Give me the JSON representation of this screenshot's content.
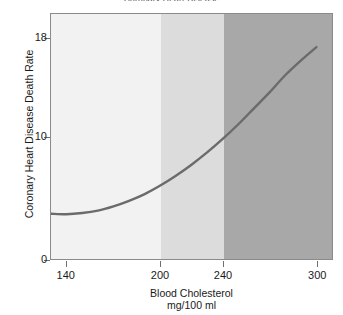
{
  "figure": {
    "title_clipped": "Coronary Heart Disease",
    "background": "#ffffff",
    "frame_color": "#8a8a8a"
  },
  "chart_data": {
    "type": "line",
    "title": "Coronary Heart Disease",
    "xlabel": "Blood Cholesterol",
    "xlabel_units": "mg/100 ml",
    "ylabel": "Coronary Heart Disease Death Rate",
    "xlim": [
      130,
      310
    ],
    "ylim": [
      0,
      20
    ],
    "xticks": [
      140,
      200,
      240,
      300
    ],
    "xticklabels": [
      "140",
      "200",
      "240",
      "300"
    ],
    "yticks": [
      0,
      10,
      18
    ],
    "yticklabels": [
      "0",
      "10",
      "18"
    ],
    "grid": false,
    "legend": "none",
    "line_color": "#6b6b6b",
    "line_width": 2.4,
    "x": [
      130,
      140,
      150,
      160,
      170,
      180,
      190,
      200,
      210,
      220,
      230,
      240,
      250,
      260,
      270,
      280,
      290,
      300
    ],
    "values": [
      3.7,
      3.65,
      3.75,
      3.95,
      4.3,
      4.75,
      5.3,
      6.0,
      6.8,
      7.7,
      8.7,
      9.8,
      11.0,
      12.3,
      13.6,
      15.0,
      16.2,
      17.3
    ],
    "series": [
      {
        "name": "CHD death rate",
        "values": [
          3.7,
          3.65,
          3.75,
          3.95,
          4.3,
          4.75,
          5.3,
          6.0,
          6.8,
          7.7,
          8.7,
          9.8,
          11.0,
          12.3,
          13.6,
          15.0,
          16.2,
          17.3
        ]
      }
    ],
    "bands": [
      {
        "name": "desirable",
        "x_start": 130,
        "x_end": 200,
        "color": "#f2f2f2"
      },
      {
        "name": "borderline-high",
        "x_start": 200,
        "x_end": 240,
        "color": "#dcdcdc"
      },
      {
        "name": "high",
        "x_start": 240,
        "x_end": 310,
        "color": "#a8a8a8"
      }
    ]
  }
}
